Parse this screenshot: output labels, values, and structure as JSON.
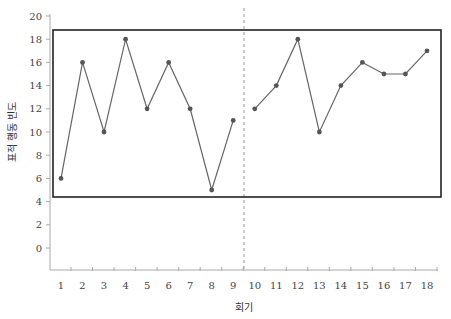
{
  "chart_data": {
    "type": "line",
    "title": "",
    "xlabel": "회기",
    "ylabel": "표적 행동 빈도",
    "x": [
      1,
      2,
      3,
      4,
      5,
      6,
      7,
      8,
      9,
      10,
      11,
      12,
      13,
      14,
      15,
      16,
      17,
      18
    ],
    "series": [
      {
        "name": "phase-A",
        "x": [
          1,
          2,
          3,
          4,
          5,
          6,
          7,
          8,
          9
        ],
        "values": [
          6,
          16,
          10,
          18,
          12,
          16,
          12,
          5,
          11
        ]
      },
      {
        "name": "phase-B",
        "x": [
          10,
          11,
          12,
          13,
          14,
          15,
          16,
          17,
          18
        ],
        "values": [
          12,
          14,
          18,
          10,
          14,
          16,
          15,
          15,
          17
        ]
      }
    ],
    "yticks": [
      0,
      2,
      4,
      6,
      8,
      10,
      12,
      14,
      16,
      18,
      20
    ],
    "xticks": [
      1,
      2,
      3,
      4,
      5,
      6,
      7,
      8,
      9,
      10,
      11,
      12,
      13,
      14,
      15,
      16,
      17,
      18
    ],
    "ylim": [
      0,
      20
    ],
    "xlim": [
      1,
      18
    ],
    "phase_change_line": {
      "between": [
        9,
        10
      ],
      "style": "dashed"
    },
    "annotation_box": {
      "y_range": [
        4.3,
        18.5
      ],
      "x_range": [
        0.6,
        18.6
      ]
    },
    "grid": false,
    "legend": null
  },
  "colors": {
    "line": "#666666",
    "marker": "#555555",
    "box": "#222222",
    "axis": "#aaaaaa",
    "dashed": "#999999"
  }
}
